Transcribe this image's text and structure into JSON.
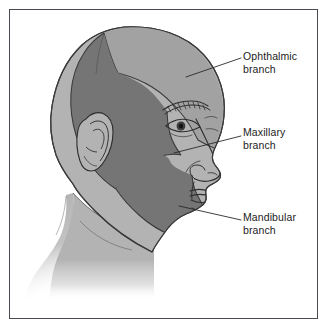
{
  "figure": {
    "frame_color": "#4a4a52",
    "background_color": "#ffffff"
  },
  "palette": {
    "scalp_light_gray": "#b3b3b3",
    "ophthalmic_mid_gray": "#a2a2a2",
    "maxillary_dark_gray": "#757575",
    "mandibular_dark_gray": "#757575",
    "outline": "#3a3a3a",
    "label_text": "#1c1c1c",
    "leader_line": "#2a2a2a"
  },
  "callouts": [
    {
      "id": "ophthalmic",
      "label_line1": "Ophthalmic",
      "label_line2": "branch",
      "label_text": "Ophthalmic\nbranch",
      "region": "forehead and upper scalp",
      "leader_from": {
        "x": 241,
        "y": 58
      },
      "leader_to": {
        "x": 186,
        "y": 77
      }
    },
    {
      "id": "maxillary",
      "label_line1": "Maxillary",
      "label_line2": "branch",
      "label_text": "Maxillary\nbranch",
      "region": "cheek, temple and upper jaw",
      "leader_from": {
        "x": 241,
        "y": 136
      },
      "leader_to": {
        "x": 174,
        "y": 153
      }
    },
    {
      "id": "mandibular",
      "label_line1": "Mandibular",
      "label_line2": "branch",
      "label_text": "Mandibular\nbranch",
      "region": "lower jaw and chin",
      "leader_from": {
        "x": 241,
        "y": 220
      },
      "leader_to": {
        "x": 179,
        "y": 206
      }
    }
  ],
  "anatomy": {
    "parts": [
      "scalp",
      "forehead",
      "eyebrow",
      "eye",
      "nose",
      "lips",
      "chin",
      "ear",
      "jaw",
      "neck",
      "shoulder"
    ]
  }
}
